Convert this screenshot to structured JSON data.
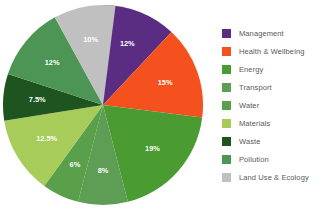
{
  "chart_data": {
    "type": "pie",
    "title": "",
    "subtitle": "",
    "xlabel": "",
    "ylabel": "",
    "grid": false,
    "legend_position": "right",
    "start_angle_deg": 0,
    "direction": "clockwise",
    "units": "percent",
    "total": 100,
    "categories": [
      "Management",
      "Health & Wellbeing",
      "Energy",
      "Transport",
      "Water",
      "Materials",
      "Waste",
      "Pollution",
      "Land Use & Ecology"
    ],
    "values": [
      12,
      15,
      19,
      8,
      6,
      12.5,
      7.5,
      12,
      10
    ],
    "data_labels": [
      "12%",
      "15%",
      "19%",
      "8%",
      "6%",
      "12.5%",
      "7.5%",
      "12%",
      "10%"
    ],
    "colors": [
      "#5b2d82",
      "#f4511e",
      "#4a9b31",
      "#5d9e54",
      "#5aa04a",
      "#a8cc5a",
      "#1e5420",
      "#4d9555",
      "#bfc0bf"
    ],
    "slices": [
      {
        "label": "Management",
        "value": 12,
        "display": "12%",
        "color": "#5b2d82",
        "label_color": "#ffffff"
      },
      {
        "label": "Health & Wellbeing",
        "value": 15,
        "display": "15%",
        "color": "#f4511e",
        "label_color": "#ffffff"
      },
      {
        "label": "Energy",
        "value": 19,
        "display": "19%",
        "color": "#4a9b31",
        "label_color": "#ffffff"
      },
      {
        "label": "Transport",
        "value": 8,
        "display": "8%",
        "color": "#5d9e54",
        "label_color": "#ffffff"
      },
      {
        "label": "Water",
        "value": 6,
        "display": "6%",
        "color": "#5aa04a",
        "label_color": "#ffffff"
      },
      {
        "label": "Materials",
        "value": 12.5,
        "display": "12.5%",
        "color": "#a8cc5a",
        "label_color": "#ffffff"
      },
      {
        "label": "Waste",
        "value": 7.5,
        "display": "7.5%",
        "color": "#1e5420",
        "label_color": "#ffffff"
      },
      {
        "label": "Pollution",
        "value": 12,
        "display": "12%",
        "color": "#4d9555",
        "label_color": "#ffffff"
      },
      {
        "label": "Land Use & Ecology",
        "value": 10,
        "display": "10%",
        "color": "#bfc0bf",
        "label_color": "#ffffff"
      }
    ]
  },
  "legend": {
    "items": [
      {
        "label": "Management",
        "color": "#5b2d82"
      },
      {
        "label": "Health & Wellbeing",
        "color": "#f4511e"
      },
      {
        "label": "Energy",
        "color": "#4a9b31"
      },
      {
        "label": "Transport",
        "color": "#5d9e54"
      },
      {
        "label": "Water",
        "color": "#5aa04a"
      },
      {
        "label": "Materials",
        "color": "#a8cc5a"
      },
      {
        "label": "Waste",
        "color": "#1e5420"
      },
      {
        "label": "Pollution",
        "color": "#4d9555"
      },
      {
        "label": "Land Use & Ecology",
        "color": "#bfc0bf"
      }
    ]
  },
  "theme": {
    "background": "#ffffff",
    "legend_text_color": "#58595b"
  }
}
